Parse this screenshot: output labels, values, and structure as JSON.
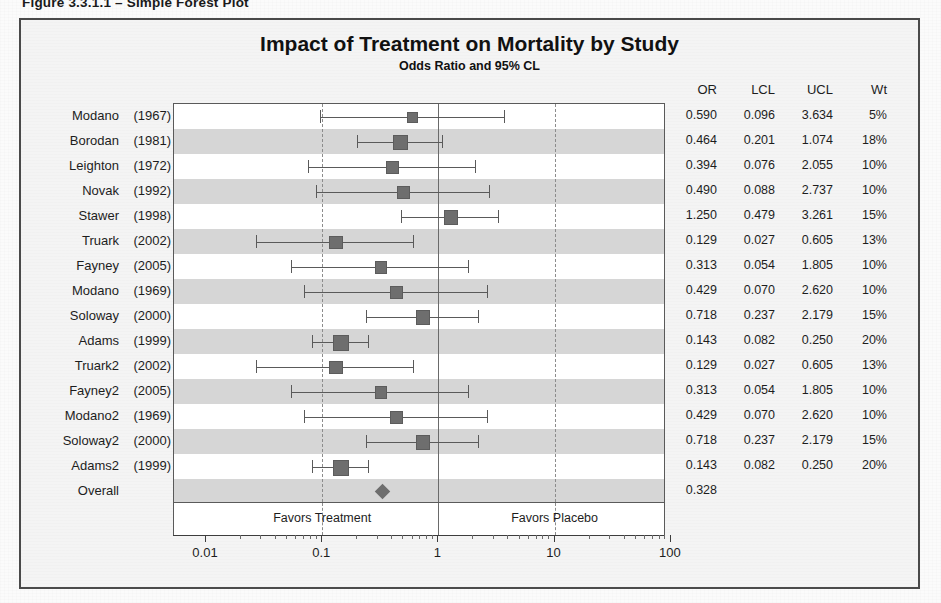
{
  "figure": {
    "caption": "Figure 3.3.1.1 – Simple Forest Plot"
  },
  "chart_data": {
    "type": "forest",
    "title": "Impact of Treatment on Mortality by Study",
    "subtitle": "Odds Ratio and 95% CL",
    "xlabel": "",
    "ylabel": "",
    "xscale": "log",
    "xlim": [
      0.01,
      100
    ],
    "xticks": [
      "0.01",
      "0.1",
      "1",
      "10",
      "100"
    ],
    "xtick_values": [
      0.01,
      0.1,
      1,
      10,
      100
    ],
    "reference_line": 1,
    "dashed_lines": [
      0.1,
      10
    ],
    "grid": false,
    "columns": [
      "OR",
      "LCL",
      "UCL",
      "Wt"
    ],
    "left_labels": [
      "study",
      "year"
    ],
    "favors_left": "Favors Treatment",
    "favors_right": "Favors Placebo",
    "favors_left_x": 0.1,
    "favors_right_x": 10,
    "overall_label": "Overall",
    "overall_or": 0.328,
    "overall_or_text": "0.328",
    "marker_color": "#6e6e6e",
    "line_color": "#5a5a5a",
    "band_color": "#d6d6d6",
    "rows": [
      {
        "study": "Modano",
        "year": "(1967)",
        "or": 0.59,
        "lcl": 0.096,
        "ucl": 3.634,
        "wt": 5,
        "or_text": "0.590",
        "lcl_text": "0.096",
        "ucl_text": "3.634",
        "wt_text": "5%"
      },
      {
        "study": "Borodan",
        "year": "(1981)",
        "or": 0.464,
        "lcl": 0.201,
        "ucl": 1.074,
        "wt": 18,
        "or_text": "0.464",
        "lcl_text": "0.201",
        "ucl_text": "1.074",
        "wt_text": "18%"
      },
      {
        "study": "Leighton",
        "year": "(1972)",
        "or": 0.394,
        "lcl": 0.076,
        "ucl": 2.055,
        "wt": 10,
        "or_text": "0.394",
        "lcl_text": "0.076",
        "ucl_text": "2.055",
        "wt_text": "10%"
      },
      {
        "study": "Novak",
        "year": "(1992)",
        "or": 0.49,
        "lcl": 0.088,
        "ucl": 2.737,
        "wt": 10,
        "or_text": "0.490",
        "lcl_text": "0.088",
        "ucl_text": "2.737",
        "wt_text": "10%"
      },
      {
        "study": "Stawer",
        "year": "(1998)",
        "or": 1.25,
        "lcl": 0.479,
        "ucl": 3.261,
        "wt": 15,
        "or_text": "1.250",
        "lcl_text": "0.479",
        "ucl_text": "3.261",
        "wt_text": "15%"
      },
      {
        "study": "Truark",
        "year": "(2002)",
        "or": 0.129,
        "lcl": 0.027,
        "ucl": 0.605,
        "wt": 13,
        "or_text": "0.129",
        "lcl_text": "0.027",
        "ucl_text": "0.605",
        "wt_text": "13%"
      },
      {
        "study": "Fayney",
        "year": "(2005)",
        "or": 0.313,
        "lcl": 0.054,
        "ucl": 1.805,
        "wt": 10,
        "or_text": "0.313",
        "lcl_text": "0.054",
        "ucl_text": "1.805",
        "wt_text": "10%"
      },
      {
        "study": "Modano",
        "year": "(1969)",
        "or": 0.429,
        "lcl": 0.07,
        "ucl": 2.62,
        "wt": 10,
        "or_text": "0.429",
        "lcl_text": "0.070",
        "ucl_text": "2.620",
        "wt_text": "10%"
      },
      {
        "study": "Soloway",
        "year": "(2000)",
        "or": 0.718,
        "lcl": 0.237,
        "ucl": 2.179,
        "wt": 15,
        "or_text": "0.718",
        "lcl_text": "0.237",
        "ucl_text": "2.179",
        "wt_text": "15%"
      },
      {
        "study": "Adams",
        "year": "(1999)",
        "or": 0.143,
        "lcl": 0.082,
        "ucl": 0.25,
        "wt": 20,
        "or_text": "0.143",
        "lcl_text": "0.082",
        "ucl_text": "0.250",
        "wt_text": "20%"
      },
      {
        "study": "Truark2",
        "year": "(2002)",
        "or": 0.129,
        "lcl": 0.027,
        "ucl": 0.605,
        "wt": 13,
        "or_text": "0.129",
        "lcl_text": "0.027",
        "ucl_text": "0.605",
        "wt_text": "13%"
      },
      {
        "study": "Fayney2",
        "year": "(2005)",
        "or": 0.313,
        "lcl": 0.054,
        "ucl": 1.805,
        "wt": 10,
        "or_text": "0.313",
        "lcl_text": "0.054",
        "ucl_text": "1.805",
        "wt_text": "10%"
      },
      {
        "study": "Modano2",
        "year": "(1969)",
        "or": 0.429,
        "lcl": 0.07,
        "ucl": 2.62,
        "wt": 10,
        "or_text": "0.429",
        "lcl_text": "0.070",
        "ucl_text": "2.620",
        "wt_text": "10%"
      },
      {
        "study": "Soloway2",
        "year": "(2000)",
        "or": 0.718,
        "lcl": 0.237,
        "ucl": 2.179,
        "wt": 15,
        "or_text": "0.718",
        "lcl_text": "0.237",
        "ucl_text": "2.179",
        "wt_text": "15%"
      },
      {
        "study": "Adams2",
        "year": "(1999)",
        "or": 0.143,
        "lcl": 0.082,
        "ucl": 0.25,
        "wt": 20,
        "or_text": "0.143",
        "lcl_text": "0.082",
        "ucl_text": "0.250",
        "wt_text": "20%"
      },
      {
        "study": "Overall",
        "year": "",
        "or": 0.328,
        "lcl": null,
        "ucl": null,
        "wt": null,
        "or_text": "0.328",
        "lcl_text": "",
        "ucl_text": "",
        "wt_text": "",
        "is_overall": true
      }
    ]
  }
}
